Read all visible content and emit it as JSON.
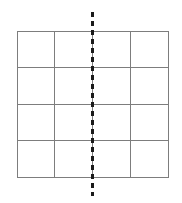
{
  "figure": {
    "background_color": "#ffffff",
    "width": 182,
    "height": 203
  },
  "grid": {
    "columns": 4,
    "rows": 4,
    "total_cells": 16,
    "line_color": "#7d7d7d",
    "line_width": 1,
    "fill_color": "none",
    "left": 17,
    "top": 31,
    "width": 152,
    "height": 147,
    "cells": [
      [
        {
          "row": 1,
          "col": 1,
          "label": "",
          "fill": "none"
        },
        {
          "row": 1,
          "col": 2,
          "label": "",
          "fill": "none"
        },
        {
          "row": 1,
          "col": 3,
          "label": "",
          "fill": "none"
        },
        {
          "row": 1,
          "col": 4,
          "label": "",
          "fill": "none"
        }
      ],
      [
        {
          "row": 2,
          "col": 1,
          "label": "",
          "fill": "none"
        },
        {
          "row": 2,
          "col": 2,
          "label": "",
          "fill": "none"
        },
        {
          "row": 2,
          "col": 3,
          "label": "",
          "fill": "none"
        },
        {
          "row": 2,
          "col": 4,
          "label": "",
          "fill": "none"
        }
      ],
      [
        {
          "row": 3,
          "col": 1,
          "label": "",
          "fill": "none"
        },
        {
          "row": 3,
          "col": 2,
          "label": "",
          "fill": "none"
        },
        {
          "row": 3,
          "col": 3,
          "label": "",
          "fill": "none"
        },
        {
          "row": 3,
          "col": 4,
          "label": "",
          "fill": "none"
        }
      ],
      [
        {
          "row": 4,
          "col": 1,
          "label": "",
          "fill": "none"
        },
        {
          "row": 4,
          "col": 2,
          "label": "",
          "fill": "none"
        },
        {
          "row": 4,
          "col": 3,
          "label": "",
          "fill": "none"
        },
        {
          "row": 4,
          "col": 4,
          "label": "",
          "fill": "none"
        }
      ]
    ]
  },
  "symmetry_line": {
    "orientation": "vertical",
    "color": "#1a1a1a",
    "stroke_width": 3,
    "dash_length": 5,
    "gap_length": 4,
    "x_position": 92,
    "top": 12,
    "bottom": 196,
    "extends_beyond_grid": true
  }
}
